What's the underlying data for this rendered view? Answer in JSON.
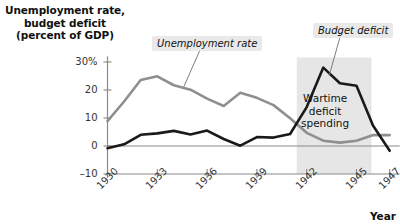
{
  "chart_data": {
    "type": "line",
    "title": "Unemployment rate, budget deficit (percent of GDP)",
    "ylabel_lines": [
      "Unemployment rate,",
      "budget deficit",
      "(percent of GDP)"
    ],
    "xlabel": "Year",
    "ylim": [
      -10,
      32
    ],
    "xlim": [
      1930,
      1947.6
    ],
    "yticks": [
      "30%",
      "20",
      "10",
      "0",
      "–10"
    ],
    "ytick_values": [
      30,
      20,
      10,
      0,
      -10
    ],
    "xticks": [
      "1930",
      "1933",
      "1936",
      "1939",
      "1942",
      "1945",
      "1947"
    ],
    "xtick_values": [
      1930,
      1933,
      1936,
      1939,
      1942,
      1945,
      1947
    ],
    "grid": false,
    "legend": "none",
    "x": [
      1930,
      1931,
      1932,
      1933,
      1934,
      1935,
      1936,
      1937,
      1938,
      1939,
      1940,
      1941,
      1942,
      1943,
      1944,
      1945,
      1946,
      1947
    ],
    "series": [
      {
        "name": "Unemployment rate",
        "color": "#8f8f8f",
        "values": [
          8.9,
          15.9,
          23.6,
          24.9,
          21.7,
          20.1,
          16.9,
          14.3,
          19.0,
          17.2,
          14.6,
          9.9,
          4.7,
          1.9,
          1.2,
          1.9,
          3.9,
          3.9
        ]
      },
      {
        "name": "Budget deficit",
        "color": "#1a1a1a",
        "values": [
          -0.8,
          0.6,
          4.0,
          4.5,
          5.4,
          4.1,
          5.5,
          2.5,
          0.1,
          3.2,
          3.0,
          4.3,
          13.9,
          28.0,
          22.4,
          21.5,
          7.2,
          -1.7
        ]
      }
    ],
    "annotations": [
      {
        "name": "unemployment-rate-callout",
        "text": "Unemployment rate",
        "style": "boxed-italic"
      },
      {
        "name": "budget-deficit-callout",
        "text": "Budget deficit",
        "style": "boxed-italic"
      },
      {
        "name": "wartime-deficit-note",
        "lines": [
          "Wartime",
          "deficit",
          "spending"
        ],
        "style": "plain"
      }
    ],
    "shaded_region": {
      "name": "wartime-shaded-band",
      "label": "Wartime deficit spending",
      "x_start": 1941.4,
      "x_end": 1945.9,
      "color": "#e6e6e6"
    },
    "colors": {
      "unemployment": "#8f8f8f",
      "deficit": "#1a1a1a",
      "shade": "#e6e6e6",
      "axis": "#888888",
      "callout_bg": "#e9e9e9"
    }
  }
}
